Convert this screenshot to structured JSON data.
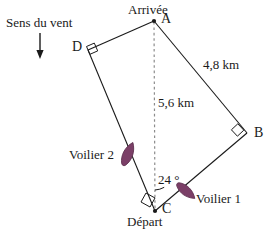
{
  "figure": {
    "type": "geometry-diagram",
    "colors": {
      "line": "#1a1a1a",
      "sail": "#7b3f67",
      "sail_outline": "#5d2f4e",
      "dashed": "#8c8c8c",
      "text": "#1a1a1a",
      "background": "#ffffff"
    },
    "wind": {
      "label": "Sens du vent",
      "arrow_icon": "down-arrow-icon"
    },
    "points": {
      "A": {
        "label": "A",
        "caption": "Arrivée",
        "x": 154,
        "y": 21
      },
      "B": {
        "label": "B",
        "caption": "",
        "x": 247,
        "y": 133
      },
      "C": {
        "label": "C",
        "caption": "Départ",
        "x": 155,
        "y": 211
      },
      "D": {
        "label": "D",
        "caption": "",
        "x": 88,
        "y": 50
      }
    },
    "measures": {
      "side_AB": "4,8 km",
      "segment_AC": "5,6 km",
      "angle_ACB": "24 °"
    },
    "boats": {
      "boat1": {
        "label": "Voilier 1"
      },
      "boat2": {
        "label": "Voilier 2"
      }
    },
    "right_angles": [
      "D",
      "B",
      "C"
    ]
  }
}
